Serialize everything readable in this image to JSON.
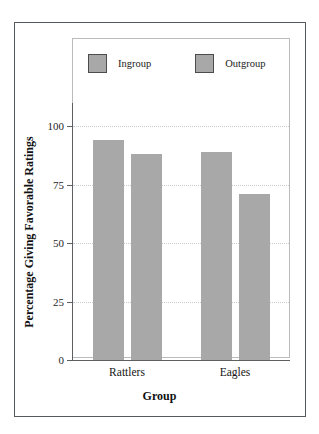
{
  "chart_data": {
    "type": "bar",
    "title": "",
    "xlabel": "Group",
    "ylabel": "Percentage Giving Favorable Ratings",
    "categories": [
      "Rattlers",
      "Eagles"
    ],
    "series": [
      {
        "name": "Ingroup",
        "values": [
          94,
          89
        ]
      },
      {
        "name": "Outgroup",
        "values": [
          88,
          71
        ]
      }
    ],
    "ylim": [
      0,
      110
    ],
    "yticks": [
      0,
      25,
      50,
      75,
      100
    ],
    "ytick_labels": [
      "0",
      "25",
      "50",
      "75",
      "100"
    ],
    "grid": true,
    "grid_axis": "y",
    "grid_style": "dotted",
    "legend_position": "top-inside",
    "bar_color": "#a8a8a8",
    "legend_border_color": "#4a4d50",
    "grid_color": "#c9ccd0",
    "axis_color": "#5c6063",
    "frame_color": "#555a5e",
    "plot_frame_color": "#b9bcbe",
    "background": "#ffffff"
  },
  "legend": {
    "entries": [
      {
        "label": "Ingroup"
      },
      {
        "label": "Outgroup"
      }
    ]
  },
  "axes": {
    "y_title": "Percentage Giving Favorable Ratings",
    "x_title": "Group",
    "y_ticks": [
      "0",
      "25",
      "50",
      "75",
      "100"
    ],
    "x_categories": [
      "Rattlers",
      "Eagles"
    ]
  }
}
